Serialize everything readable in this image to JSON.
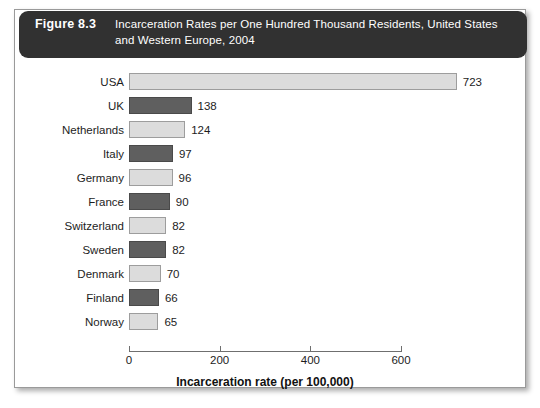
{
  "figure": {
    "number": "Figure 8.3",
    "caption": "Incarceration Rates per One Hundred Thousand Residents, United States and Western Europe, 2004"
  },
  "chart_data": {
    "type": "bar",
    "orientation": "horizontal",
    "title": "Incarceration Rates per One Hundred Thousand Residents, United States and Western Europe, 2004",
    "xlabel": "Incarceration rate (per 100,000)",
    "ylabel": "",
    "xlim": [
      0,
      600
    ],
    "xticks": [
      0,
      200,
      400,
      600
    ],
    "xtick_labels": [
      "0",
      "200",
      "400",
      "600"
    ],
    "grid": false,
    "legend": null,
    "categories": [
      "USA",
      "UK",
      "Netherlands",
      "Italy",
      "Germany",
      "France",
      "Switzerland",
      "Sweden",
      "Denmark",
      "Finland",
      "Norway"
    ],
    "values": [
      723,
      138,
      124,
      97,
      96,
      90,
      82,
      82,
      70,
      66,
      65
    ],
    "value_labels": [
      "723",
      "138",
      "124",
      "97",
      "96",
      "90",
      "82",
      "82",
      "70",
      "66",
      "65"
    ],
    "bar_fill_pattern": [
      "light",
      "dark",
      "light",
      "dark",
      "light",
      "dark",
      "light",
      "dark",
      "light",
      "dark",
      "light"
    ],
    "colors": {
      "bar_dark": "#5f5f5f",
      "bar_light": "#dcdcdc",
      "bar_border": "#8a8a8a",
      "header_background": "#313131",
      "header_text": "#ffffff",
      "panel_background": "#ffffff",
      "axis": "#6f6f6f"
    }
  }
}
